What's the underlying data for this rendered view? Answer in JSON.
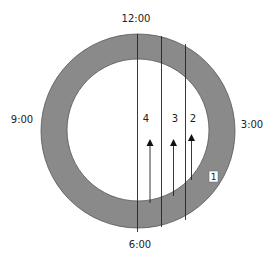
{
  "diagram": {
    "clock_labels": {
      "top": "12:00",
      "right": "3:00",
      "bottom": "6:00",
      "left": "9:00"
    },
    "ring": {
      "fill_color": "#8a8a8a",
      "stroke_color": "#444444",
      "inner_fill": "#ffffff"
    },
    "line_labels": [
      "4",
      "3",
      "2"
    ],
    "box_label": "1"
  }
}
